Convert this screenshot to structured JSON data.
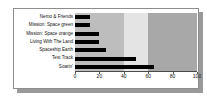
{
  "chart_data": {
    "type": "bar",
    "orientation": "horizontal",
    "title": "",
    "subtitle": "",
    "xlabel": "",
    "ylabel": "",
    "categories": [
      "Nemo & Friends",
      "Mission: Space green",
      "Mission: Space orange",
      "Living With The Land",
      "Spaceship Earth",
      "Test Track",
      "Soarin'"
    ],
    "values": [
      12,
      12,
      20,
      20,
      25,
      50,
      65
    ],
    "xlim": [
      0,
      100
    ],
    "ylim_categories": 7,
    "xticks": [
      0,
      20,
      40,
      60,
      80,
      100
    ],
    "xticklabels": [
      "0",
      "20",
      "40",
      "60",
      "80",
      "100"
    ],
    "grid": false,
    "legend": null,
    "bar_color": "#000000",
    "background_bands": [
      {
        "from": 0,
        "to": 40,
        "color": "#bdbdbd"
      },
      {
        "from": 40,
        "to": 60,
        "color": "#e4e4e4"
      },
      {
        "from": 60,
        "to": 100,
        "color": "#a8a8a8"
      }
    ],
    "plot_background": "#ffffff"
  },
  "card": {
    "border_color": "#8d8d8d",
    "shadow_color": "#9a9a9a",
    "background": "#ffffff"
  }
}
